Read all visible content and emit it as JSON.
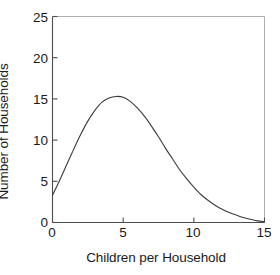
{
  "chart_data": {
    "type": "line",
    "title": "",
    "xlabel": "Children per Household",
    "ylabel": "Number of Households",
    "xlim": [
      0,
      15
    ],
    "ylim": [
      0,
      25
    ],
    "xticks": [
      0,
      5,
      10,
      15
    ],
    "yticks": [
      0,
      5,
      10,
      15,
      20,
      25
    ],
    "xtick_labels": [
      "0",
      "5",
      "10",
      "15"
    ],
    "ytick_labels": [
      "0",
      "5",
      "10",
      "15",
      "20",
      "25"
    ],
    "grid": false,
    "legend": false,
    "line_color": "#3a3a3a",
    "background_color": "#ffffff",
    "axis_color": "#4d4d4d",
    "series": [
      {
        "name": "Number of Households",
        "x": [
          0,
          0.5,
          1,
          1.5,
          2,
          2.5,
          3,
          3.5,
          4,
          4.5,
          5,
          5.5,
          6,
          6.5,
          7,
          7.5,
          8,
          8.5,
          9,
          9.5,
          10,
          10.5,
          11,
          11.5,
          12,
          12.5,
          13,
          13.5,
          14,
          14.5,
          15
        ],
        "y": [
          3.3,
          5.1,
          7.0,
          8.9,
          10.7,
          12.3,
          13.6,
          14.6,
          15.1,
          15.3,
          15.2,
          14.7,
          13.9,
          12.9,
          11.7,
          10.4,
          9.0,
          7.7,
          6.4,
          5.3,
          4.3,
          3.4,
          2.7,
          2.1,
          1.6,
          1.2,
          0.9,
          0.6,
          0.4,
          0.2,
          0.1
        ]
      }
    ],
    "annotations": {
      "peak_x": 4.8,
      "peak_y": 15.3,
      "start_y": 3.3,
      "end_y": 0.1
    }
  }
}
